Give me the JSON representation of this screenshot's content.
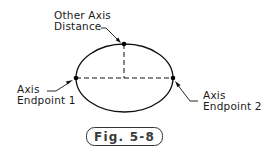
{
  "diagram": {
    "colors": {
      "stroke": "#111111",
      "text": "#1a1a1a",
      "figure_label_text": "#3a3a3a",
      "background": "#ffffff"
    },
    "ellipse": {
      "cx": 124.5,
      "cy": 78,
      "rx": 48.5,
      "ry": 34
    },
    "points": [
      {
        "name": "axis-endpoint-1",
        "x": 76,
        "y": 78
      },
      {
        "name": "axis-endpoint-2",
        "x": 173,
        "y": 78
      },
      {
        "name": "other-axis-distance",
        "x": 124,
        "y": 44
      }
    ],
    "labels": {
      "other_axis": {
        "line1": "Other Axis",
        "line2": "Distance"
      },
      "endpoint1": {
        "line1": "Axis",
        "line2": "Endpoint 1"
      },
      "endpoint2": {
        "line1": "Axis",
        "line2": "Endpoint 2"
      }
    },
    "figure_label": "Fig. 5-8"
  }
}
